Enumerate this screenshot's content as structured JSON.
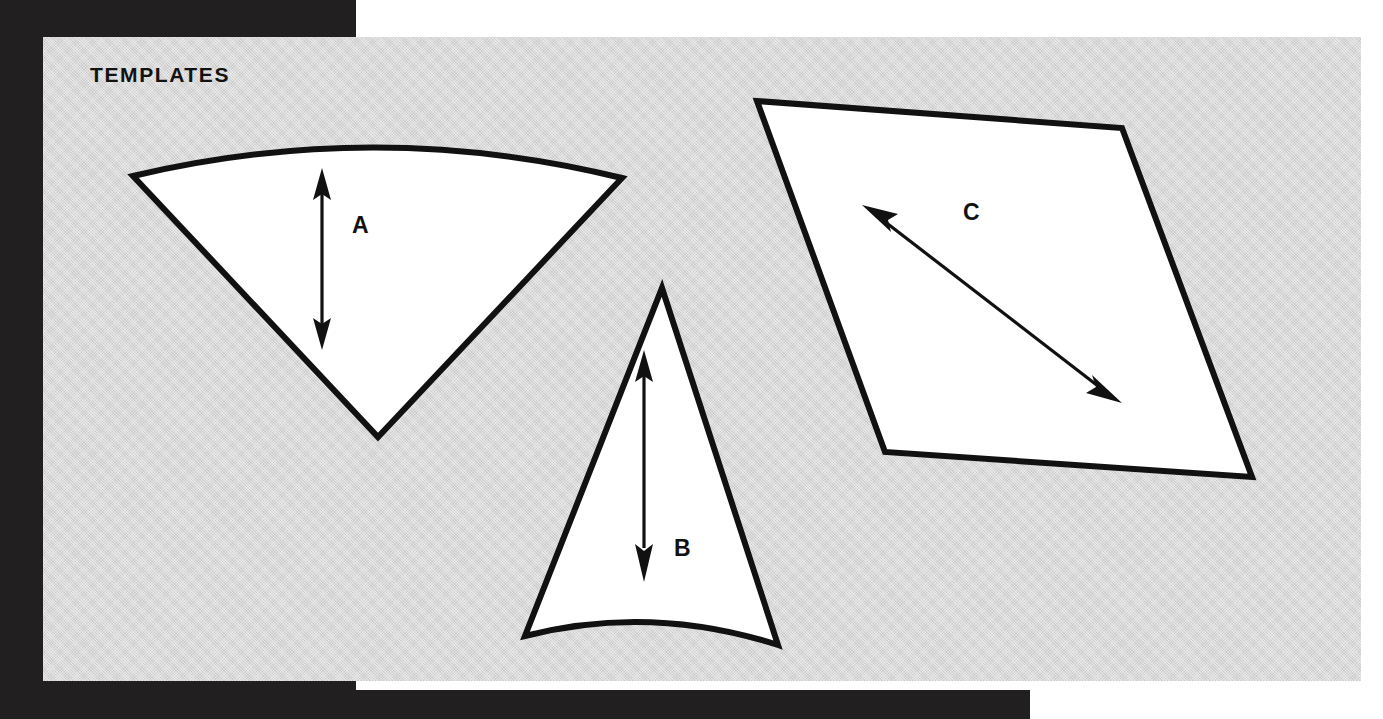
{
  "page": {
    "title": "TEMPLATES",
    "background_color": "#ffffff",
    "frame_color": "#211f1f",
    "plate_color": "#d4d4d4",
    "ink_color": "#111111",
    "shape_fill": "#ffffff"
  },
  "shapes": [
    {
      "label": "A",
      "name": "template-shape-a",
      "description": "fan / wedge template, curved top edge, apex pointing down",
      "dimension_arrow": "vertical double-headed"
    },
    {
      "label": "B",
      "name": "template-shape-b",
      "description": "narrow triangular template, concave bottom edge, apex pointing up",
      "dimension_arrow": "vertical double-headed"
    },
    {
      "label": "C",
      "name": "template-shape-c",
      "description": "parallelogram template",
      "dimension_arrow": "diagonal double-headed"
    }
  ]
}
